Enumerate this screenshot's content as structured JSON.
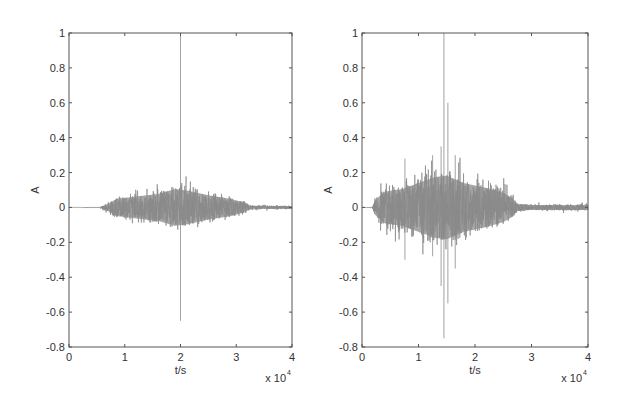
{
  "chart_data": [
    {
      "type": "line",
      "title": "",
      "xlabel": "t/s",
      "ylabel": "A",
      "x_multiplier_label": "x 10",
      "x_multiplier_exp": "4",
      "xlim": [
        0,
        40000
      ],
      "ylim": [
        -0.8,
        1
      ],
      "xticks": [
        0,
        1,
        2,
        3,
        4
      ],
      "xtick_labels": [
        "0",
        "1",
        "2",
        "3",
        "4"
      ],
      "yticks": [
        1,
        0.8,
        0.6,
        0.4,
        0.2,
        0,
        -0.2,
        -0.4,
        -0.6,
        -0.8
      ],
      "ytick_labels": [
        "1",
        "0.8",
        "0.6",
        "0.4",
        "0.2",
        "0",
        "-0.2",
        "-0.4",
        "-0.6",
        "-0.8"
      ],
      "grid": false,
      "series": [
        {
          "name": "waveform",
          "color": "#8a8a8a",
          "description": "Noisy burst waveform, onset ~6000, peak envelope ~0.15 near 20000, decays by ~32000, low noise tail to 40000",
          "envelope": [
            [
              0,
              0.001
            ],
            [
              5500,
              0.002
            ],
            [
              7000,
              0.03
            ],
            [
              8500,
              0.07
            ],
            [
              12000,
              0.09
            ],
            [
              16000,
              0.11
            ],
            [
              19000,
              0.15
            ],
            [
              21000,
              0.14
            ],
            [
              25000,
              0.1
            ],
            [
              29000,
              0.07
            ],
            [
              31500,
              0.04
            ],
            [
              32500,
              0.015
            ],
            [
              40000,
              0.01
            ]
          ],
          "spikes": [
            [
              20000,
              1.0,
              -0.65
            ]
          ]
        }
      ]
    },
    {
      "type": "line",
      "title": "",
      "xlabel": "t/s",
      "ylabel": "A",
      "x_multiplier_label": "x 10",
      "x_multiplier_exp": "4",
      "xlim": [
        0,
        40000
      ],
      "ylim": [
        -0.8,
        1
      ],
      "xticks": [
        0,
        1,
        2,
        3,
        4
      ],
      "xtick_labels": [
        "0",
        "1",
        "2",
        "3",
        "4"
      ],
      "yticks": [
        1,
        0.8,
        0.6,
        0.4,
        0.2,
        0,
        -0.2,
        -0.4,
        -0.6,
        -0.8
      ],
      "ytick_labels": [
        "1",
        "0.8",
        "0.6",
        "0.4",
        "0.2",
        "0",
        "-0.2",
        "-0.4",
        "-0.6",
        "-0.8"
      ],
      "grid": false,
      "series": [
        {
          "name": "waveform",
          "color": "#8a8a8a",
          "description": "Noisy burst waveform, onset ~2000, peak envelope ~0.25 near 14500, decays by ~27000, noise tail ~0.02 to 40000",
          "envelope": [
            [
              0,
              0.001
            ],
            [
              1800,
              0.002
            ],
            [
              2300,
              0.06
            ],
            [
              4000,
              0.13
            ],
            [
              7000,
              0.15
            ],
            [
              10000,
              0.2
            ],
            [
              13000,
              0.25
            ],
            [
              15000,
              0.26
            ],
            [
              18000,
              0.2
            ],
            [
              22000,
              0.16
            ],
            [
              25000,
              0.12
            ],
            [
              26500,
              0.08
            ],
            [
              27500,
              0.03
            ],
            [
              30000,
              0.02
            ],
            [
              40000,
              0.02
            ]
          ],
          "spikes": [
            [
              14500,
              1.0,
              -0.75
            ],
            [
              15200,
              0.6,
              -0.55
            ],
            [
              14000,
              0.35,
              -0.45
            ],
            [
              7600,
              0.28,
              -0.3
            ],
            [
              12500,
              0.3,
              -0.28
            ],
            [
              16500,
              0.3,
              -0.35
            ]
          ]
        }
      ]
    }
  ]
}
